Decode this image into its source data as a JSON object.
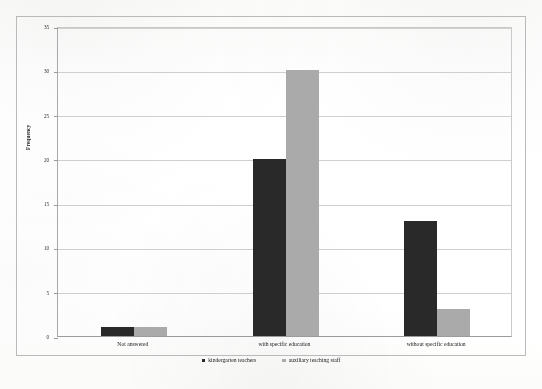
{
  "chart_data": {
    "type": "bar",
    "title": "",
    "subtitle": "",
    "xlabel": "",
    "ylabel": "Frequency",
    "categories": [
      "Not answered",
      "with specific education",
      "without specific education"
    ],
    "series": [
      {
        "name": "kindergarten teachers",
        "color": "#2b2b2b",
        "values": [
          1,
          20,
          13
        ]
      },
      {
        "name": "auxiliary teaching staff",
        "color": "#a9a9a9",
        "values": [
          1,
          30,
          3
        ]
      }
    ],
    "ylim": [
      0,
      35
    ],
    "ytick_step": 5,
    "ytick_labels": [
      "0",
      "5",
      "10",
      "15",
      "20",
      "25",
      "30",
      "35"
    ],
    "grid": true,
    "grid_axis": "y",
    "legend_position": "bottom-center",
    "annotations": []
  }
}
